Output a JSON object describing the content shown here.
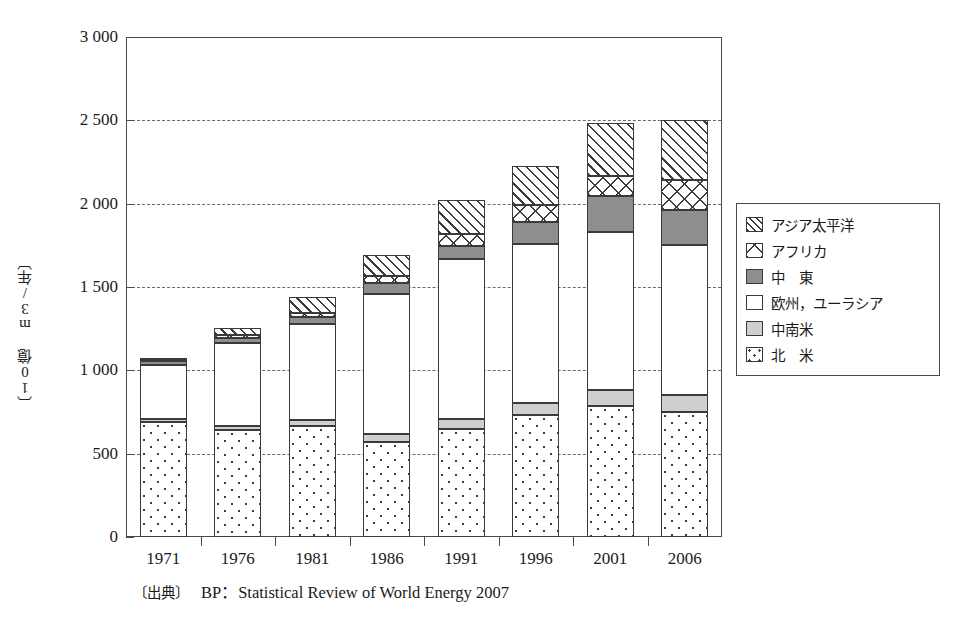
{
  "figure": {
    "y_axis_title": "〔10億 m3/年〕",
    "y_axis_title_plain": "〔10億 m³/年〕",
    "source_tag": "〔出典〕",
    "source_text": "BP：Statistical Review of World Energy 2007"
  },
  "legend": {
    "items": [
      {
        "label": "アジア太平洋",
        "pattern": "diagonal-hatch",
        "color": "#ffffff"
      },
      {
        "label": "アフリカ",
        "pattern": "cross-hatch",
        "color": "#ffffff"
      },
      {
        "label": "中　東",
        "pattern": "solid-gray",
        "color": "#8e8e8e"
      },
      {
        "label": "欧州，ユーラシア",
        "pattern": "checkerboard",
        "color": "#2e2e2e"
      },
      {
        "label": "中南米",
        "pattern": "light-gray",
        "color": "#cfcfcf"
      },
      {
        "label": "北　米",
        "pattern": "dotted",
        "color": "#ffffff"
      }
    ]
  },
  "chart_data": {
    "type": "bar",
    "subtype": "stacked-vertical",
    "title": "",
    "xlabel": "",
    "ylabel": "〔10億 m³/年〕",
    "ylim": [
      0,
      3000
    ],
    "ytick_labels": [
      "0",
      "500",
      "1 000",
      "1 500",
      "2 000",
      "2 500",
      "3 000"
    ],
    "ytick_values": [
      0,
      500,
      1000,
      1500,
      2000,
      2500,
      3000
    ],
    "grid": "horizontal-dashed",
    "gridline_values": [
      500,
      1000,
      1500,
      2000,
      2500
    ],
    "legend_position": "right-outside",
    "categories": [
      "1971",
      "1976",
      "1981",
      "1986",
      "1991",
      "1996",
      "2001",
      "2006"
    ],
    "series": [
      {
        "name": "北　米",
        "key": "namerica",
        "values": [
          690,
          640,
          665,
          570,
          650,
          730,
          785,
          750
        ]
      },
      {
        "name": "中南米",
        "key": "latam",
        "values": [
          20,
          25,
          35,
          50,
          60,
          75,
          95,
          105
        ]
      },
      {
        "name": "欧州，ユーラシア",
        "key": "eurasia",
        "values": [
          320,
          500,
          580,
          840,
          960,
          955,
          950,
          900
        ]
      },
      {
        "name": "中　東",
        "key": "mideast",
        "values": [
          25,
          30,
          40,
          65,
          75,
          130,
          215,
          210
        ]
      },
      {
        "name": "アフリカ",
        "key": "africa",
        "values": [
          5,
          15,
          25,
          40,
          75,
          105,
          120,
          180
        ]
      },
      {
        "name": "アジア太平洋",
        "key": "asia",
        "values": [
          10,
          45,
          95,
          130,
          200,
          230,
          320,
          360
        ]
      }
    ],
    "totals": [
      1070,
      1255,
      1440,
      1695,
      2020,
      2225,
      2485,
      2505
    ],
    "totals_note": [
      "1 070",
      "1 255",
      "1 440",
      "1 695",
      "2 020",
      "2 225",
      "2 485",
      "2 850"
    ],
    "units": "10億 m³/年"
  }
}
